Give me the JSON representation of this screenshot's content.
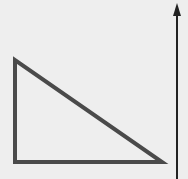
{
  "diagram": {
    "background": "#eeeeee",
    "triangle": {
      "shape": "right-triangle",
      "vertices": [
        [
          15,
          60
        ],
        [
          15,
          162
        ],
        [
          162,
          162
        ]
      ],
      "stroke": "#4a4a4a",
      "stroke_width": 4,
      "fill": "none"
    },
    "arrow": {
      "direction": "up",
      "x": 177,
      "y_start": 179,
      "y_end": 3,
      "stroke": "#222222",
      "stroke_width": 2,
      "head_color": "#222222"
    }
  }
}
